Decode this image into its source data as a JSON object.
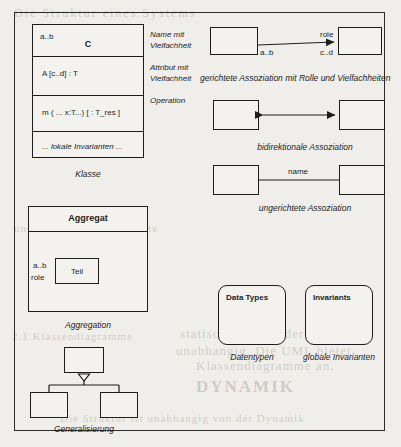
{
  "figure": {
    "language": "de",
    "frame_color": "#2b2b2b",
    "background": "#efeeea"
  },
  "class_diagram": {
    "multiplicity": "a..b",
    "name": "C",
    "attribute": "A [c..d] : T",
    "operation": "m ( ... x:T...) [ : T_res ]",
    "invariants": "... lokale Invarianten ...",
    "caption": "Klasse"
  },
  "annotations": [
    {
      "line1": "Name mit",
      "line2": "Vielfachheit"
    },
    {
      "line1": "Attribut mit",
      "line2": "Vielfachheit"
    },
    {
      "line1": "Operation",
      "line2": ""
    }
  ],
  "aggregation": {
    "title": "Aggregat",
    "part": "Teil",
    "multiplicity": "a..b",
    "role": "role",
    "caption": "Aggregation"
  },
  "generalisation": {
    "caption": "Generalisierung",
    "parent": "",
    "children": [
      "",
      ""
    ]
  },
  "associations": [
    {
      "kind": "directed",
      "role": "role",
      "source_multiplicity": "a..b",
      "target_multiplicity": "c..d",
      "caption": "gerichtete Assoziation mit Rolle und Vielfachheiten"
    },
    {
      "kind": "bidirectional",
      "caption": "bidirektionale Assoziation"
    },
    {
      "kind": "undirected",
      "name": "name",
      "caption": "ungerichtete Assoziation"
    }
  ],
  "data_types": {
    "title": "Data Types",
    "caption": "Datentypen"
  },
  "invariants": {
    "title": "Invariants",
    "caption": "globale Invarianten"
  },
  "bleed_text": {
    "t1": "Die Struktur eines Systems",
    "t2": "statisch und von der Dynamik",
    "t3": "unabhangig. Die UML bietet",
    "t4": "Klassendiagramme an.",
    "t5": "2.1  Klassendiagramme",
    "t6": "Abbildung 2.1",
    "t7": "DYNAMIK",
    "t8": "STRUKTUR",
    "t9": "DYNAMIK",
    "t10": "Die Struktur ist unabhangig von der Dynamik",
    "t11": "und beschreibt die Objekte"
  }
}
